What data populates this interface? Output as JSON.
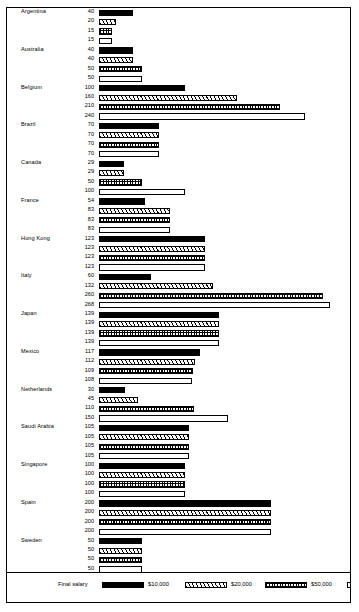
{
  "chart_data": {
    "type": "bar",
    "title": "",
    "xlabel": "",
    "ylabel": "",
    "orientation": "horizontal",
    "grid": false,
    "legend_position": "bottom",
    "legend_title": "Final salary",
    "series": [
      {
        "name": "$10,000",
        "pattern": "solid-black"
      },
      {
        "name": "$20,000",
        "pattern": "diagonal-hatch"
      },
      {
        "name": "$50,000",
        "pattern": "fine-dotted"
      },
      {
        "name": "$100,000",
        "pattern": "empty-white"
      }
    ],
    "categories": [
      "Argentina",
      "Australia",
      "Belgium",
      "Brazil",
      "Canada",
      "France",
      "Hong Kong",
      "Italy",
      "Japan",
      "Mexico",
      "Netherlands",
      "Saudi Arabia",
      "Singapore",
      "Spain",
      "Sweden",
      "Switzerland",
      "United Kingdom",
      "United States",
      "Venezuela",
      "West Germany"
    ],
    "values_by_category": {
      "Argentina": [
        40,
        20,
        15,
        15
      ],
      "Australia": [
        40,
        40,
        50,
        50
      ],
      "Belgium": [
        100,
        160,
        210,
        240
      ],
      "Brazil": [
        70,
        70,
        70,
        70
      ],
      "Canada": [
        29,
        29,
        50,
        100
      ],
      "France": [
        54,
        83,
        83,
        83
      ],
      "Hong Kong": [
        123,
        123,
        123,
        123
      ],
      "Italy": [
        60,
        132,
        260,
        268
      ],
      "Japan": [
        139,
        139,
        139,
        139
      ],
      "Mexico": [
        117,
        112,
        109,
        108
      ],
      "Netherlands": [
        30,
        45,
        110,
        150
      ],
      "Saudi Arabia": [
        105,
        105,
        105,
        105
      ],
      "Singapore": [
        100,
        100,
        100,
        100
      ],
      "Spain": [
        200,
        200,
        200,
        200
      ],
      "Sweden": [
        50,
        50,
        50,
        50
      ],
      "Switzerland": [
        25,
        33,
        42,
        50
      ],
      "United Kingdom": [
        80,
        100,
        150,
        200
      ],
      "United States": [
        29,
        35,
        48,
        58
      ],
      "Venezuela": [
        267,
        267,
        267,
        267
      ],
      "West Germany": [
        60,
        60,
        75,
        125
      ]
    },
    "xlim": [
      0,
      268
    ],
    "scale_px_per_unit": 0.86
  },
  "legend": {
    "title": "Final salary",
    "items": [
      {
        "label": "$10,000"
      },
      {
        "label": "$20,000"
      },
      {
        "label": "$50,000"
      },
      {
        "label": "$100,000"
      }
    ]
  }
}
